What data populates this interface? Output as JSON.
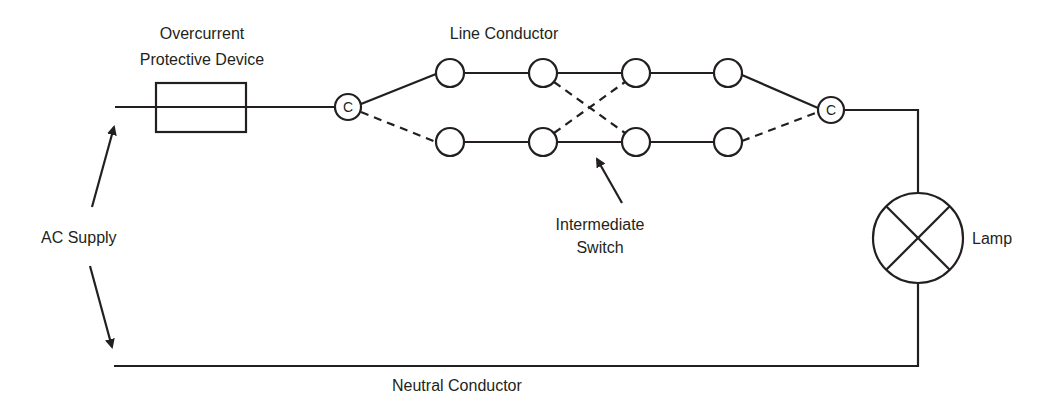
{
  "diagram": {
    "type": "circuit-schematic",
    "stroke_color": "#231f20",
    "background": "#ffffff"
  },
  "labels": {
    "overcurrent_line1": "Overcurrent",
    "overcurrent_line2": "Protective Device",
    "line_conductor": "Line Conductor",
    "intermediate_line1": "Intermediate",
    "intermediate_line2": "Switch",
    "ac_supply": "AC Supply",
    "lamp": "Lamp",
    "neutral_conductor": "Neutral Conductor"
  },
  "components": {
    "common_left": {
      "letter": "C"
    },
    "common_right": {
      "letter": "C"
    },
    "terminals_top": 4,
    "terminals_bottom": 4
  }
}
